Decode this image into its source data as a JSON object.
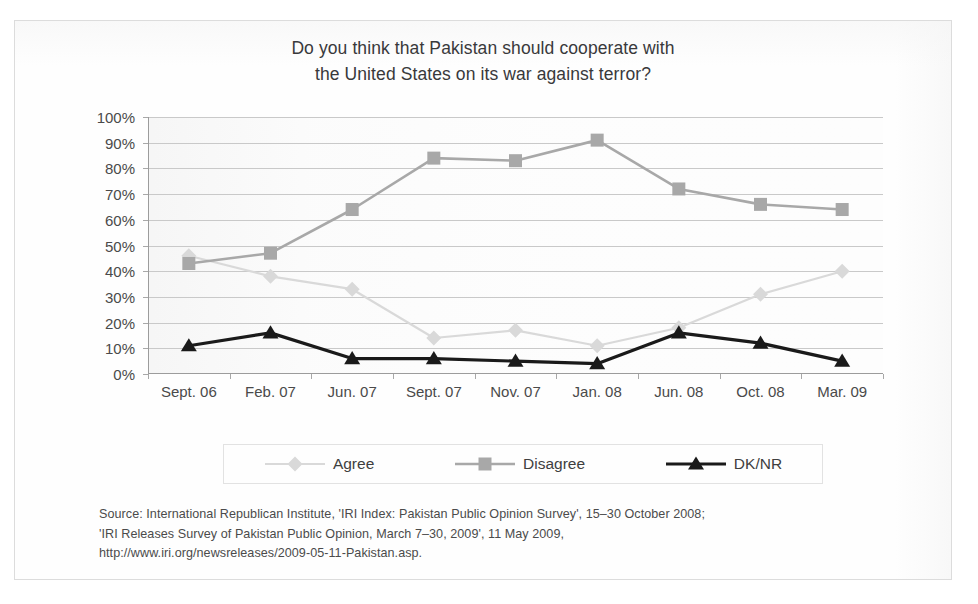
{
  "chart_data": {
    "type": "line",
    "title": "Do you think that Pakistan should cooperate with the United States on its war against terror?",
    "title_lines": [
      "Do you think that Pakistan should cooperate with",
      "the United States on its war against terror?"
    ],
    "xlabel": "",
    "ylabel": "",
    "ylim": [
      0,
      100
    ],
    "yticks": [
      0,
      10,
      20,
      30,
      40,
      50,
      60,
      70,
      80,
      90,
      100
    ],
    "ytick_labels": [
      "0%",
      "10%",
      "20%",
      "30%",
      "40%",
      "50%",
      "60%",
      "70%",
      "80%",
      "90%",
      "100%"
    ],
    "grid": true,
    "legend_position": "bottom",
    "categories": [
      "Sept. 06",
      "Feb. 07",
      "Jun. 07",
      "Sept. 07",
      "Nov. 07",
      "Jan. 08",
      "Jun. 08",
      "Oct. 08",
      "Mar. 09"
    ],
    "series": [
      {
        "name": "Agree",
        "color": "#d9d9d9",
        "marker": "diamond",
        "values": [
          46,
          38,
          33,
          14,
          17,
          11,
          18,
          31,
          40
        ]
      },
      {
        "name": "Disagree",
        "color": "#a8a8a8",
        "marker": "square",
        "values": [
          43,
          47,
          64,
          84,
          83,
          91,
          72,
          66,
          64
        ]
      },
      {
        "name": "DK/NR",
        "color": "#1a1a1a",
        "marker": "triangle",
        "values": [
          11,
          16,
          6,
          6,
          5,
          4,
          16,
          12,
          5
        ]
      }
    ]
  },
  "legend": {
    "items": [
      {
        "label": "Agree"
      },
      {
        "label": "Disagree"
      },
      {
        "label": "DK/NR"
      }
    ]
  },
  "source": {
    "lines": [
      "Source: International Republican Institute, 'IRI Index: Pakistan Public Opinion Survey', 15–30 October 2008;",
      "'IRI Releases Survey of Pakistan Public Opinion, March 7–30, 2009', 11 May 2009,",
      "http://www.iri.org/newsreleases/2009-05-11-Pakistan.asp."
    ]
  },
  "colors": {
    "agree": "#d9d9d9",
    "disagree": "#a8a8a8",
    "dknr": "#1a1a1a",
    "gridline": "#c9c9c9",
    "axis": "#9c9c9c",
    "text": "#3b3b3b"
  }
}
